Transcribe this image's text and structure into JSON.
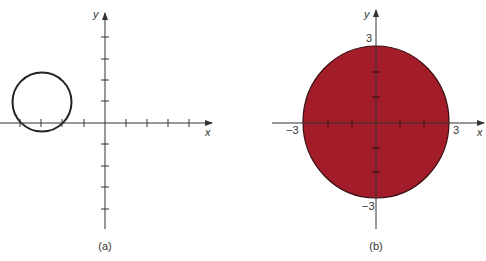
{
  "figure_a": {
    "caption": "(a)",
    "x_axis_label": "x",
    "y_axis_label": "y",
    "shape": "circle outline",
    "circle": {
      "center": [
        -3,
        1
      ],
      "radius": 1.4
    },
    "tick_unit": 1
  },
  "figure_b": {
    "caption": "(b)",
    "x_axis_label": "x",
    "y_axis_label": "y",
    "shape": "filled disk",
    "circle": {
      "center": [
        0,
        0
      ],
      "radius": 3
    },
    "fill_color": "#A31C2A",
    "tick_labels": {
      "x_neg": "−3",
      "x_pos": "3",
      "y_pos": "3",
      "y_neg": "−3"
    }
  }
}
